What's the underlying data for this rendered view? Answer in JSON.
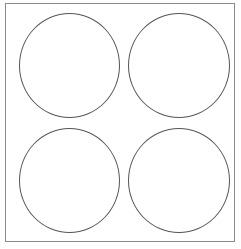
{
  "diagram": {
    "frame": {
      "border_color": "#8a8a8a"
    },
    "circles": [
      {
        "position": "top-left",
        "stroke": "#555555"
      },
      {
        "position": "top-right",
        "stroke": "#555555"
      },
      {
        "position": "bottom-left",
        "stroke": "#555555"
      },
      {
        "position": "bottom-right",
        "stroke": "#555555"
      }
    ]
  }
}
